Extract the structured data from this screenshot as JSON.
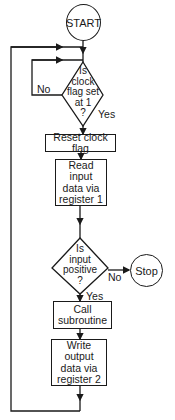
{
  "flowchart": {
    "start": "START",
    "decision1": {
      "lines": [
        "Is",
        "clock",
        "flag set",
        "at 1",
        "?"
      ],
      "no": "No",
      "yes": "Yes"
    },
    "process1": "Reset clock flag",
    "process2": {
      "lines": [
        "Read input",
        "data via",
        "register 1"
      ]
    },
    "decision2": {
      "lines": [
        "Is",
        "input",
        "positive",
        "?"
      ],
      "no": "No",
      "yes": "Yes"
    },
    "stop": "Stop",
    "process3": {
      "lines": [
        "Call",
        "subroutine"
      ]
    },
    "process4": {
      "lines": [
        "Write output",
        "data via",
        "register 2"
      ]
    }
  }
}
